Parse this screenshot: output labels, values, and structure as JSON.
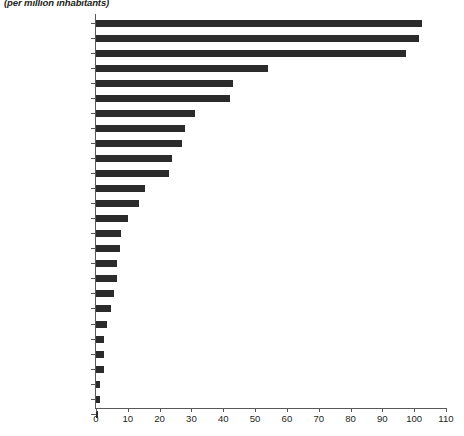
{
  "chart_data": {
    "type": "bar",
    "orientation": "horizontal",
    "title": "",
    "subtitle": "(per million inhabitants)",
    "xlabel": "",
    "ylabel": "",
    "xlim": [
      0,
      110
    ],
    "xticks": [
      0,
      10,
      20,
      30,
      40,
      50,
      60,
      70,
      80,
      90,
      100,
      110
    ],
    "grid": false,
    "legend": null,
    "bar_color": "#2b2b2b",
    "axis_color": "#58595b",
    "categories": [
      "United Kingdom",
      "United States",
      "Denmark",
      "Portugal",
      "Czech Republic",
      "Singapore",
      "Romania",
      "France",
      "Spain",
      "Germany",
      "Poland",
      "Russia",
      "Italy",
      "Argentina",
      "Turkey",
      "Chile",
      "Brazil",
      "South Africa",
      "Mexico",
      "Malaysia",
      "Lebanon",
      "Egypt, Arab Rep.",
      "Morocco",
      "Indonesia",
      "Tunisia",
      "Thailand",
      "Algeria"
    ],
    "values": [
      102.5,
      101.5,
      97.5,
      54,
      43,
      42,
      31,
      28,
      27,
      24,
      23,
      15.5,
      13.5,
      10,
      7.8,
      7.6,
      6.7,
      6.5,
      5.7,
      4.7,
      3.5,
      2.6,
      2.5,
      2.4,
      1.4,
      1.4,
      0.6
    ]
  }
}
